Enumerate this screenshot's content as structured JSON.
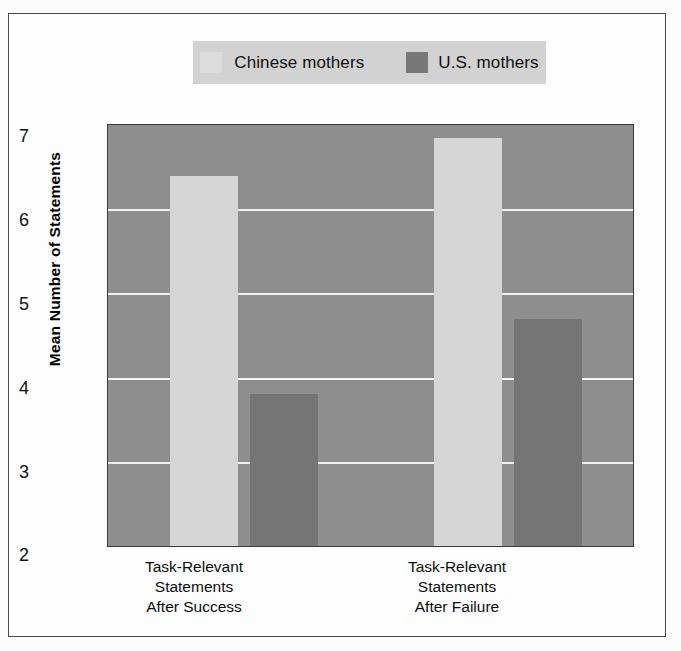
{
  "chart_data": {
    "type": "bar",
    "title": "",
    "xlabel": "",
    "ylabel": "Mean Number of Statements",
    "ylim": [
      2,
      7
    ],
    "yticks": [
      "7",
      "6",
      "5",
      "4",
      "3",
      "2"
    ],
    "ytick_values": [
      7,
      6,
      5,
      4,
      3,
      2
    ],
    "grid": true,
    "legend_position": "top",
    "categories": [
      "Task-Relevant\nStatements\nAfter Success",
      "Task-Relevant\nStatements\nAfter Failure"
    ],
    "category_lines": [
      [
        "Task-Relevant",
        "Statements",
        "After Success"
      ],
      [
        "Task-Relevant",
        "Statements",
        "After Failure"
      ]
    ],
    "series": [
      {
        "name": "Chinese mothers",
        "color": "#d6d6d6",
        "values": [
          6.4,
          6.85
        ]
      },
      {
        "name": "U.S. mothers",
        "color": "#757575",
        "values": [
          3.8,
          4.7
        ]
      }
    ]
  },
  "legend": {
    "entries": [
      {
        "label": "Chinese mothers",
        "swatch": "legend-swatch-chinese"
      },
      {
        "label": "U.S. mothers",
        "swatch": "legend-swatch-us"
      }
    ]
  },
  "axis": {
    "y_title": "Mean Number of Statements",
    "y_tick_7": "7",
    "y_tick_6": "6",
    "y_tick_5": "5",
    "y_tick_4": "4",
    "y_tick_3": "3",
    "y_tick_2": "2"
  },
  "x_labels": {
    "group1_line1": "Task-Relevant",
    "group1_line2": "Statements",
    "group1_line3": "After Success",
    "group2_line1": "Task-Relevant",
    "group2_line2": "Statements",
    "group2_line3": "After Failure"
  },
  "colors": {
    "chinese_bar": "#d6d6d6",
    "us_bar": "#757575",
    "plot_background": "#8e8e8e",
    "gridline": "#f2f2f2",
    "legend_background": "#d2d2d2"
  }
}
